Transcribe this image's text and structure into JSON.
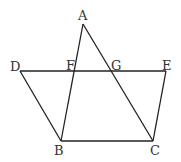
{
  "diagram": {
    "points": {
      "A": {
        "label": "A",
        "x": 83,
        "y": 24,
        "lx": 78,
        "ly": 20
      },
      "B": {
        "label": "B",
        "x": 61,
        "y": 141,
        "lx": 54,
        "ly": 155
      },
      "C": {
        "label": "C",
        "x": 153,
        "y": 141,
        "lx": 150,
        "ly": 155
      },
      "D": {
        "label": "D",
        "x": 20,
        "y": 71,
        "lx": 10,
        "ly": 71
      },
      "E": {
        "label": "E",
        "x": 166,
        "y": 71,
        "lx": 162,
        "ly": 70
      },
      "F": {
        "label": "F",
        "x": 74,
        "y": 71,
        "lx": 67,
        "ly": 71
      },
      "G": {
        "label": "G",
        "x": 111,
        "y": 71,
        "lx": 112,
        "ly": 71
      }
    },
    "segments": [
      [
        "A",
        "B"
      ],
      [
        "A",
        "C"
      ],
      [
        "D",
        "E"
      ],
      [
        "D",
        "B"
      ],
      [
        "E",
        "C"
      ],
      [
        "B",
        "C"
      ]
    ]
  }
}
